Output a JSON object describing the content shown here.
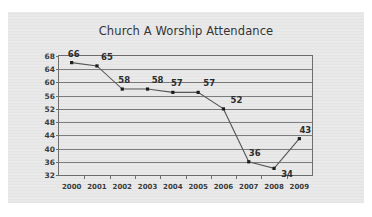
{
  "card": {
    "background": "#e9e9e9"
  },
  "chart_data": {
    "type": "line",
    "title": "Church A Worship Attendance",
    "xlabel": "",
    "ylabel": "",
    "categories": [
      "2000",
      "2001",
      "2002",
      "2003",
      "2004",
      "2005",
      "2006",
      "2007",
      "2008",
      "2009"
    ],
    "values": [
      66,
      65,
      58,
      58,
      57,
      57,
      52,
      36,
      34,
      43
    ],
    "series": [
      {
        "name": "Attendance",
        "values": [
          66,
          65,
          58,
          58,
          57,
          57,
          52,
          36,
          34,
          43
        ]
      }
    ],
    "point_labels": [
      "66",
      "65",
      "58",
      "58",
      "57",
      "57",
      "52",
      "36",
      "34",
      "43"
    ],
    "yticks": [
      68,
      64,
      60,
      56,
      52,
      48,
      44,
      40,
      36,
      32
    ],
    "ytick_labels": [
      "68",
      "64",
      "60",
      "56",
      "52",
      "48",
      "44",
      "40",
      "36",
      "32"
    ],
    "ylim": [
      32,
      68
    ],
    "grid": true,
    "legend": "none",
    "line_color": "#555555",
    "marker_color": "#1a1a1a",
    "axis_color": "#6e6e6e",
    "grid_color": "#7a7a7a",
    "title_color": "#333333",
    "plot_background": "#e9e9e9"
  }
}
